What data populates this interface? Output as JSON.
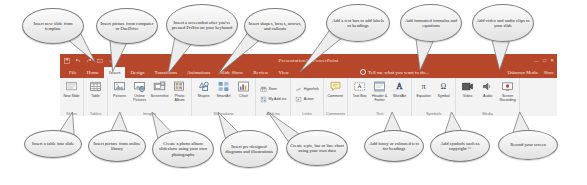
{
  "window": {
    "title": "Presentation1 - PowerPoint",
    "account": "Unknown Media",
    "share": "Share",
    "tellme": "Tell me what you want to do...",
    "qat": [
      "save-icon",
      "undo-icon",
      "redo-icon",
      "start-slideshow-icon",
      "customize-qat-icon"
    ],
    "controls": [
      "minimize-icon",
      "maximize-icon",
      "close-icon"
    ]
  },
  "tabs": [
    {
      "label": "File",
      "active": false
    },
    {
      "label": "Home",
      "active": false
    },
    {
      "label": "Insert",
      "active": true
    },
    {
      "label": "Design",
      "active": false
    },
    {
      "label": "Transitions",
      "active": false
    },
    {
      "label": "Animations",
      "active": false
    },
    {
      "label": "Slide Show",
      "active": false
    },
    {
      "label": "Review",
      "active": false
    },
    {
      "label": "View",
      "active": false
    }
  ],
  "ribbon": {
    "groups": [
      {
        "name": "Slides",
        "label": "Slides",
        "buttons": [
          {
            "label": "New\nSlide",
            "icon": "new-slide-icon"
          }
        ]
      },
      {
        "name": "Tables",
        "label": "Tables",
        "buttons": [
          {
            "label": "Table",
            "icon": "table-icon"
          }
        ]
      },
      {
        "name": "Images",
        "label": "Images",
        "buttons": [
          {
            "label": "Pictures",
            "icon": "pictures-icon"
          },
          {
            "label": "Online\nPictures",
            "icon": "online-pictures-icon"
          },
          {
            "label": "Screenshot",
            "icon": "screenshot-icon"
          },
          {
            "label": "Photo\nAlbum",
            "icon": "photo-album-icon"
          }
        ]
      },
      {
        "name": "Illustrations",
        "label": "Illustrations",
        "buttons": [
          {
            "label": "Shapes",
            "icon": "shapes-icon"
          },
          {
            "label": "SmartArt",
            "icon": "smartart-icon"
          },
          {
            "label": "Chart",
            "icon": "chart-icon"
          }
        ]
      },
      {
        "name": "Add-ins",
        "label": "Add-ins",
        "buttons": [
          {
            "label": "Store",
            "icon": "store-icon"
          },
          {
            "label": "My Add-ins",
            "icon": "my-addins-icon"
          }
        ]
      },
      {
        "name": "Links",
        "label": "Links",
        "buttons": [
          {
            "label": "Hyperlink",
            "icon": "hyperlink-icon"
          },
          {
            "label": "Action",
            "icon": "action-icon"
          }
        ]
      },
      {
        "name": "Comments",
        "label": "Comments",
        "buttons": [
          {
            "label": "Comment",
            "icon": "comment-icon"
          }
        ]
      },
      {
        "name": "Text",
        "label": "Text",
        "buttons": [
          {
            "label": "Text\nBox",
            "icon": "text-box-icon"
          },
          {
            "label": "Header\n& Footer",
            "icon": "header-footer-icon"
          },
          {
            "label": "WordArt",
            "icon": "wordart-icon"
          }
        ]
      },
      {
        "name": "Symbols",
        "label": "Symbols",
        "buttons": [
          {
            "label": "Equation",
            "icon": "equation-icon"
          },
          {
            "label": "Symbol",
            "icon": "symbol-icon"
          }
        ]
      },
      {
        "name": "Media",
        "label": "Media",
        "buttons": [
          {
            "label": "Video",
            "icon": "video-icon"
          },
          {
            "label": "Audio",
            "icon": "audio-icon"
          },
          {
            "label": "Screen\nRecording",
            "icon": "screen-recording-icon"
          }
        ]
      }
    ]
  },
  "callouts": {
    "top": [
      {
        "id": "new-slide",
        "text": "Insert new slide from template"
      },
      {
        "id": "pictures",
        "text": "Insert picture from computer or OneDrive"
      },
      {
        "id": "screenshot",
        "text": "Insert a screenshot after you've pressed PrtScn on your keyboard"
      },
      {
        "id": "shapes",
        "text": "Insert shapes, boxes, arrows, and callouts"
      },
      {
        "id": "text-box",
        "text": "Add a text box to add labels or headings"
      },
      {
        "id": "equation",
        "text": "Add formatted formulas and equations"
      },
      {
        "id": "media",
        "text": "Add video and audio clips to your slide"
      }
    ],
    "bottom": [
      {
        "id": "table",
        "text": "Insert a table into slide"
      },
      {
        "id": "online-pictures",
        "text": "Insert picture from online library"
      },
      {
        "id": "photo-album",
        "text": "Create a photo album slideshow using your own photographs"
      },
      {
        "id": "smartart",
        "text": "Insert pre-designed diagrams and illustrations"
      },
      {
        "id": "chart",
        "text": "Create a pie, bar or line chart using your own data"
      },
      {
        "id": "wordart",
        "text": "Add fancy or coloured text for headings"
      },
      {
        "id": "symbol",
        "text": "Add symbols such as copyright ©"
      },
      {
        "id": "screen-recording",
        "text": "Record your screen"
      }
    ]
  },
  "colors": {
    "ribbon_accent": "#b7472a",
    "ribbon_bg": "#f3f3f3",
    "callout_fill": "#ededed",
    "callout_stroke": "#7d7d7d"
  }
}
